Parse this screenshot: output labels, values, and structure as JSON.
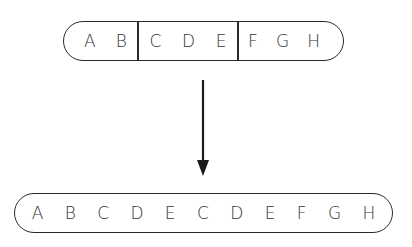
{
  "diagram": {
    "top_sequence": {
      "segments": [
        {
          "letters": [
            "A",
            "B"
          ]
        },
        {
          "letters": [
            "C",
            "D",
            "E"
          ]
        },
        {
          "letters": [
            "F",
            "G",
            "H"
          ]
        }
      ]
    },
    "arrow": {
      "direction": "down"
    },
    "bottom_sequence": {
      "letters": [
        "A",
        "B",
        "C",
        "D",
        "E",
        "C",
        "D",
        "E",
        "F",
        "G",
        "H"
      ]
    }
  }
}
